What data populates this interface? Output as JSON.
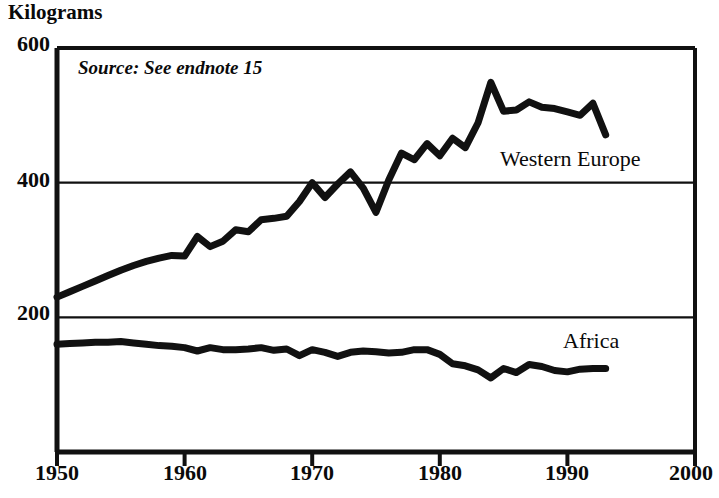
{
  "chart_data": {
    "type": "line",
    "title": "",
    "ylabel": "Kilograms",
    "xlabel": "",
    "ylim": [
      0,
      600
    ],
    "xlim": [
      1950,
      2000
    ],
    "yticks": [
      200,
      400,
      600
    ],
    "xticks": [
      1950,
      1960,
      1970,
      1980,
      1990,
      2000
    ],
    "grid": "horizontal-at-yticks",
    "annotation": "Source: See endnote 15",
    "legend_position": "inline-right",
    "series": [
      {
        "name": "Western Europe",
        "label_x": 1983.5,
        "label_y": 452,
        "x": [
          1950,
          1951,
          1952,
          1953,
          1954,
          1955,
          1956,
          1957,
          1958,
          1959,
          1960,
          1961,
          1962,
          1963,
          1964,
          1965,
          1966,
          1967,
          1968,
          1969,
          1970,
          1971,
          1972,
          1973,
          1974,
          1975,
          1976,
          1977,
          1978,
          1979,
          1980,
          1981,
          1982,
          1983,
          1984,
          1985,
          1986,
          1987,
          1988,
          1989,
          1990,
          1991,
          1992,
          1993
        ],
        "values": [
          230,
          238,
          246,
          254,
          262,
          270,
          277,
          283,
          288,
          292,
          291,
          320,
          305,
          313,
          330,
          327,
          345,
          347,
          350,
          372,
          400,
          378,
          398,
          416,
          392,
          356,
          404,
          444,
          434,
          458,
          440,
          466,
          452,
          489,
          549,
          506,
          508,
          520,
          512,
          510,
          505,
          500,
          518,
          471
        ]
      },
      {
        "name": "Africa",
        "label_x": 1987.5,
        "label_y": 175,
        "x": [
          1950,
          1951,
          1952,
          1953,
          1954,
          1955,
          1956,
          1957,
          1958,
          1959,
          1960,
          1961,
          1962,
          1963,
          1964,
          1965,
          1966,
          1967,
          1968,
          1969,
          1970,
          1971,
          1972,
          1973,
          1974,
          1975,
          1976,
          1977,
          1978,
          1979,
          1980,
          1981,
          1982,
          1983,
          1984,
          1985,
          1986,
          1987,
          1988,
          1989,
          1990,
          1991,
          1992,
          1993
        ],
        "values": [
          160,
          161,
          162,
          163,
          163,
          164,
          162,
          160,
          158,
          157,
          155,
          150,
          155,
          152,
          152,
          153,
          155,
          151,
          153,
          143,
          152,
          148,
          142,
          148,
          150,
          149,
          147,
          148,
          152,
          152,
          145,
          131,
          128,
          122,
          110,
          124,
          118,
          130,
          127,
          121,
          119,
          123,
          124,
          124
        ]
      }
    ]
  },
  "labels": {
    "y_axis_title": "Kilograms",
    "y_600": "600",
    "y_400": "400",
    "y_200": "200",
    "x_1950": "1950",
    "x_1960": "1960",
    "x_1970": "1970",
    "x_1980": "1980",
    "x_1990": "1990",
    "x_2000": "2000",
    "source": "Source: See endnote 15",
    "series_western_europe": "Western Europe",
    "series_africa": "Africa"
  },
  "colors": {
    "line": "#111111",
    "axis": "#111111",
    "grid": "#111111",
    "background": "#ffffff"
  }
}
